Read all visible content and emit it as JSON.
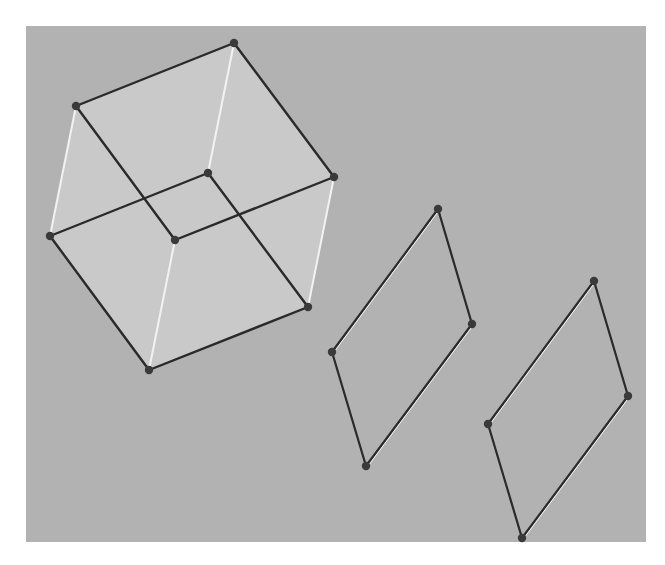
{
  "figure": {
    "background": {
      "x": 26,
      "y": 26,
      "width": 620,
      "height": 516,
      "color": "#b2b2b2"
    },
    "page_color": "#ffffff",
    "colors": {
      "face_fill": "#c9c9c9",
      "dark_edge": "#2a2a2a",
      "light_edge": "#f2f2f2",
      "vertex": "#3a3a3a"
    }
  },
  "cube": {
    "vertices": {
      "A": [
        76,
        106
      ],
      "B": [
        234,
        43
      ],
      "C": [
        334,
        177
      ],
      "D": [
        175,
        240
      ],
      "E": [
        50,
        236
      ],
      "F": [
        208,
        173
      ],
      "G": [
        308,
        307
      ],
      "H": [
        149,
        370
      ]
    },
    "silhouette": [
      "A",
      "B",
      "C",
      "G",
      "H",
      "E"
    ],
    "dark_edges": [
      [
        "A",
        "B"
      ],
      [
        "B",
        "C"
      ],
      [
        "A",
        "D"
      ],
      [
        "D",
        "C"
      ],
      [
        "E",
        "F"
      ],
      [
        "F",
        "G"
      ],
      [
        "E",
        "H"
      ],
      [
        "H",
        "G"
      ]
    ],
    "light_edges": [
      [
        "A",
        "E"
      ],
      [
        "B",
        "F"
      ],
      [
        "C",
        "G"
      ],
      [
        "D",
        "H"
      ]
    ]
  },
  "parallelograms": [
    {
      "name": "parallelogram-1",
      "vertices": {
        "top": [
          438,
          209
        ],
        "right": [
          472,
          324
        ],
        "bottom": [
          366,
          466
        ],
        "left": [
          332,
          352
        ]
      },
      "dark_edges": [
        [
          "top",
          "right"
        ],
        [
          "left",
          "bottom"
        ]
      ],
      "light_edges": [
        [
          "left",
          "top"
        ],
        [
          "bottom",
          "right"
        ]
      ]
    },
    {
      "name": "parallelogram-2",
      "vertices": {
        "top": [
          594,
          281
        ],
        "right": [
          628,
          396
        ],
        "bottom": [
          522,
          538
        ],
        "left": [
          488,
          424
        ]
      },
      "dark_edges": [
        [
          "top",
          "right"
        ],
        [
          "left",
          "bottom"
        ]
      ],
      "light_edges": [
        [
          "left",
          "top"
        ],
        [
          "bottom",
          "right"
        ]
      ]
    }
  ]
}
